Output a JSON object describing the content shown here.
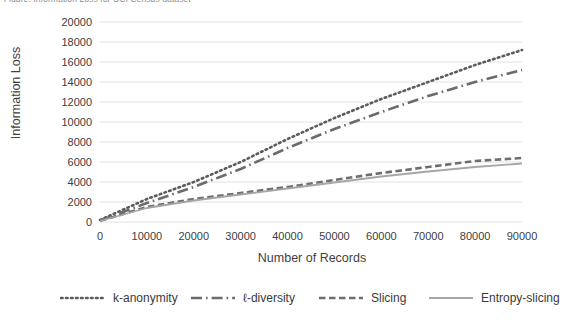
{
  "caption": "Figure: Information Loss for UCI Census dataset",
  "chart_data": {
    "type": "line",
    "title": "",
    "subtitle": "",
    "xlabel": "Number of Records",
    "ylabel": "Information Loss",
    "xlim": [
      0,
      90000
    ],
    "ylim": [
      0,
      20000
    ],
    "xticks": [
      0,
      10000,
      20000,
      30000,
      40000,
      50000,
      60000,
      70000,
      80000,
      90000
    ],
    "yticks": [
      0,
      2000,
      4000,
      6000,
      8000,
      10000,
      12000,
      14000,
      16000,
      18000,
      20000
    ],
    "xtick_labels": [
      "0",
      "10000",
      "20000",
      "30000",
      "40000",
      "50000",
      "60000",
      "70000",
      "80000",
      "90000"
    ],
    "ytick_labels": [
      "0",
      "2000",
      "4000",
      "6000",
      "8000",
      "10000",
      "12000",
      "14000",
      "16000",
      "18000",
      "20000"
    ],
    "grid": "horizontal",
    "legend_position": "bottom",
    "x": [
      0,
      10000,
      20000,
      30000,
      40000,
      50000,
      60000,
      70000,
      80000,
      90000
    ],
    "series": [
      {
        "name": "k-anonymity",
        "style": "dotted",
        "color": "#5c5c5c",
        "values": [
          200,
          2300,
          4000,
          6000,
          8300,
          10400,
          12300,
          14000,
          15700,
          17200
        ]
      },
      {
        "name": "ℓ-diversity",
        "style": "dash-dot",
        "color": "#6b6b6b",
        "values": [
          150,
          1900,
          3500,
          5300,
          7400,
          9300,
          11000,
          12600,
          14000,
          15200
        ]
      },
      {
        "name": "Slicing",
        "style": "dashed",
        "color": "#6e6e6e",
        "values": [
          120,
          1500,
          2300,
          2900,
          3500,
          4200,
          4900,
          5500,
          6100,
          6400
        ]
      },
      {
        "name": "Entropy-slicing",
        "style": "solid",
        "color": "#a6a6a6",
        "values": [
          100,
          1400,
          2150,
          2750,
          3350,
          3950,
          4550,
          5050,
          5500,
          5850
        ]
      }
    ]
  },
  "legend": [
    {
      "label": "k-anonymity",
      "style": "dotted",
      "color": "#5c5c5c"
    },
    {
      "label": "ℓ-diversity",
      "style": "dash-dot",
      "color": "#6b6b6b"
    },
    {
      "label": "Slicing",
      "style": "dashed",
      "color": "#6e6e6e"
    },
    {
      "label": "Entropy-slicing",
      "style": "solid",
      "color": "#a6a6a6"
    }
  ],
  "colors": {
    "grid": "#e2e2e2",
    "text": "#3f3f3f",
    "background": "#ffffff"
  }
}
